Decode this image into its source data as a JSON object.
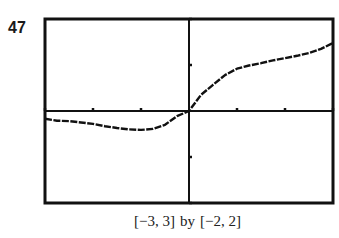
{
  "problem_number": "47",
  "caption": {
    "x_window": "[−3, 3]",
    "by": "by",
    "y_window": "[−2, 2]"
  },
  "colors": {
    "frame": "#111111",
    "axes": "#111111",
    "curve": "#111111",
    "background": "#ffffff"
  },
  "chart_data": {
    "type": "line",
    "title": "",
    "xlabel": "",
    "ylabel": "",
    "xlim": [
      -3,
      3
    ],
    "ylim": [
      -2,
      2
    ],
    "x_ticks": [
      -3,
      -2,
      -1,
      0,
      1,
      2,
      3
    ],
    "y_ticks": [
      -2,
      -1,
      0,
      1,
      2
    ],
    "grid": false,
    "legend": null,
    "window_caption": "[−3, 3] by [−2, 2]",
    "series": [
      {
        "name": "f(x)",
        "x": [
          -3,
          -2.75,
          -2.5,
          -2.25,
          -2,
          -1.75,
          -1.5,
          -1.25,
          -1,
          -0.75,
          -0.5,
          -0.25,
          0,
          0.25,
          0.5,
          0.75,
          1,
          1.25,
          1.5,
          1.75,
          2,
          2.25,
          2.5,
          2.75,
          3
        ],
        "values": [
          -0.17,
          -0.21,
          -0.22,
          -0.25,
          -0.28,
          -0.33,
          -0.37,
          -0.4,
          -0.41,
          -0.39,
          -0.3,
          -0.11,
          0,
          0.35,
          0.57,
          0.78,
          0.92,
          0.99,
          1.04,
          1.1,
          1.15,
          1.2,
          1.26,
          1.35,
          1.48
        ]
      }
    ]
  }
}
